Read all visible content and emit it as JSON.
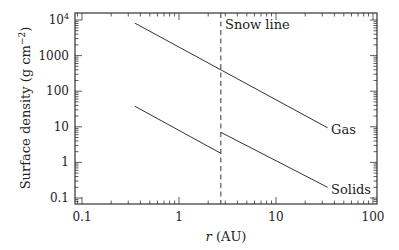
{
  "chart_data": {
    "type": "line",
    "title": "",
    "xlabel": "r (AU)",
    "ylabel": "Surface density (g cm⁻²)",
    "xscale": "log",
    "yscale": "log",
    "xlim": [
      0.08,
      110
    ],
    "ylim": [
      0.08,
      15000
    ],
    "x_ticks": [
      0.1,
      1,
      10,
      100
    ],
    "x_tick_labels": [
      "0.1",
      "1",
      "10",
      "100"
    ],
    "y_ticks": [
      0.1,
      1,
      10,
      100,
      1000,
      10000
    ],
    "y_tick_labels": [
      "0.1",
      "1",
      "10",
      "100",
      "1000",
      "10⁴"
    ],
    "grid": false,
    "series": [
      {
        "name": "Gas",
        "label": "Gas",
        "x": [
          0.35,
          34
        ],
        "y": [
          8200,
          9.4
        ]
      },
      {
        "name": "Solids (inner)",
        "label": "",
        "x": [
          0.35,
          2.7
        ],
        "y": [
          38,
          1.8
        ]
      },
      {
        "name": "Solids",
        "label": "Solids",
        "x": [
          2.7,
          34
        ],
        "y": [
          7.0,
          0.2
        ]
      }
    ],
    "annotations": [
      {
        "type": "vline",
        "x": 2.7,
        "style": "dashed",
        "label": "Snow line"
      }
    ]
  },
  "labels": {
    "gas": "Gas",
    "solids": "Solids",
    "snow_line": "Snow line",
    "xlabel_italic": "r",
    "xlabel_unit": " (AU)",
    "ylabel_main": "Surface density (g cm",
    "ylabel_exp": "−2",
    "ylabel_close": ")"
  },
  "colors": {
    "line": "#333333",
    "axis": "#333333",
    "background": "#ffffff"
  }
}
